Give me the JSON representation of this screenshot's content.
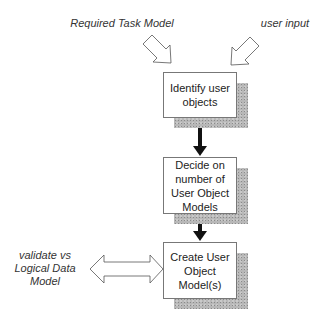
{
  "inputs": {
    "left_label": "Required Task Model",
    "right_label": "user input"
  },
  "steps": [
    {
      "label": "Identify user objects"
    },
    {
      "label": "Decide on number of User Object Models"
    },
    {
      "label": "Create User Object Model(s)"
    }
  ],
  "side": {
    "label_lines": [
      "validate vs",
      "Logical Data",
      "Model"
    ]
  },
  "colors": {
    "box_border": "#777777",
    "arrow": "#111111",
    "shadow": "#b8b8b8"
  }
}
